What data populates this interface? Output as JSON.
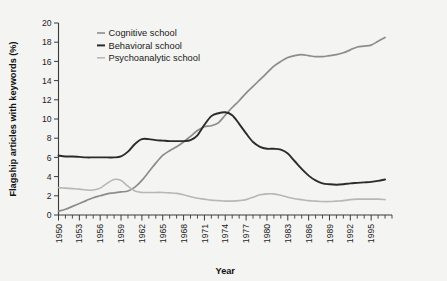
{
  "figure": {
    "background_color": "#f4f4f2"
  },
  "chart_data": {
    "type": "line",
    "title": "",
    "xlabel": "Year",
    "ylabel": "Flagship articles with keywords (%)",
    "xlim": [
      1950,
      1998
    ],
    "ylim": [
      0,
      20
    ],
    "y_ticks": [
      0,
      2,
      4,
      6,
      8,
      10,
      12,
      14,
      16,
      18,
      20
    ],
    "x_ticks_labeled": [
      1950,
      1953,
      1956,
      1959,
      1962,
      1965,
      1968,
      1971,
      1974,
      1977,
      1980,
      1983,
      1986,
      1989,
      1992,
      1995
    ],
    "x_tick_interval_minor": 1,
    "grid": false,
    "legend_position": "top-center",
    "x": [
      1950,
      1951,
      1952,
      1953,
      1954,
      1955,
      1956,
      1957,
      1958,
      1959,
      1960,
      1961,
      1962,
      1963,
      1964,
      1965,
      1966,
      1967,
      1968,
      1969,
      1970,
      1971,
      1972,
      1973,
      1974,
      1975,
      1976,
      1977,
      1978,
      1979,
      1980,
      1981,
      1982,
      1983,
      1984,
      1985,
      1986,
      1987,
      1988,
      1989,
      1990,
      1991,
      1992,
      1993,
      1994,
      1995,
      1996,
      1997
    ],
    "series": [
      {
        "name": "Cognitive school",
        "color": "#8c8c8c",
        "width": 1.7,
        "values": [
          0.4,
          0.6,
          0.9,
          1.2,
          1.5,
          1.8,
          2.0,
          2.2,
          2.3,
          2.4,
          2.5,
          2.9,
          3.6,
          4.5,
          5.4,
          6.2,
          6.7,
          7.1,
          7.6,
          8.2,
          8.8,
          9.2,
          9.3,
          9.6,
          10.4,
          11.2,
          11.9,
          12.7,
          13.4,
          14.1,
          14.8,
          15.5,
          16.0,
          16.4,
          16.6,
          16.7,
          16.6,
          16.5,
          16.5,
          16.6,
          16.7,
          16.9,
          17.2,
          17.5,
          17.6,
          17.7,
          18.1,
          18.5
        ]
      },
      {
        "name": "Behavioral school",
        "color": "#2b2b2b",
        "width": 1.9,
        "values": [
          6.2,
          6.1,
          6.1,
          6.05,
          6.0,
          6.0,
          6.0,
          6.0,
          6.0,
          6.1,
          6.6,
          7.4,
          7.9,
          7.9,
          7.8,
          7.75,
          7.7,
          7.7,
          7.7,
          7.8,
          8.3,
          9.4,
          10.3,
          10.6,
          10.7,
          10.4,
          9.5,
          8.5,
          7.6,
          7.1,
          6.9,
          6.9,
          6.8,
          6.4,
          5.6,
          4.8,
          4.1,
          3.6,
          3.3,
          3.2,
          3.15,
          3.2,
          3.3,
          3.35,
          3.4,
          3.45,
          3.55,
          3.7
        ]
      },
      {
        "name": "Psychoanalytic school",
        "color": "#b7b7b7",
        "width": 1.6,
        "values": [
          2.85,
          2.8,
          2.75,
          2.7,
          2.6,
          2.6,
          2.8,
          3.3,
          3.7,
          3.6,
          3.0,
          2.5,
          2.35,
          2.35,
          2.35,
          2.35,
          2.3,
          2.25,
          2.1,
          1.9,
          1.75,
          1.65,
          1.55,
          1.5,
          1.45,
          1.45,
          1.5,
          1.6,
          1.85,
          2.1,
          2.2,
          2.2,
          2.05,
          1.85,
          1.7,
          1.6,
          1.5,
          1.45,
          1.4,
          1.4,
          1.45,
          1.5,
          1.6,
          1.65,
          1.65,
          1.65,
          1.65,
          1.6
        ]
      }
    ]
  },
  "legend": {
    "items": [
      {
        "label": "Cognitive school",
        "color": "#8c8c8c"
      },
      {
        "label": "Behavioral school",
        "color": "#2b2b2b"
      },
      {
        "label": "Psychoanalytic school",
        "color": "#b7b7b7"
      }
    ]
  }
}
